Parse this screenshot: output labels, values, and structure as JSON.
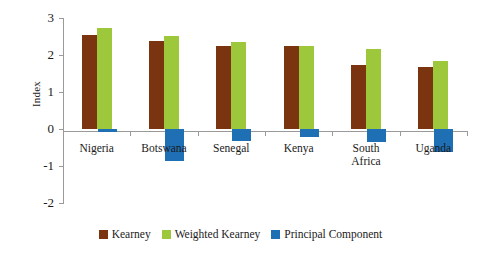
{
  "chart_data": {
    "type": "bar",
    "title": "",
    "xlabel": "",
    "ylabel": "Index",
    "ylim": [
      -2,
      3
    ],
    "yticks": [
      3,
      2,
      1,
      0,
      -1,
      -2
    ],
    "grid": false,
    "legend_position": "bottom",
    "categories": [
      "Nigeria",
      "Botswana",
      "Senegal",
      "Kenya",
      "South Africa",
      "Uganda"
    ],
    "series": [
      {
        "name": "Kearney",
        "color": "#7B3410",
        "values": [
          2.55,
          2.37,
          2.23,
          2.25,
          1.72,
          1.68
        ]
      },
      {
        "name": "Weighted Kearney",
        "color": "#9DC83C",
        "values": [
          2.73,
          2.52,
          2.35,
          2.25,
          2.17,
          1.83
        ]
      },
      {
        "name": "Principal Component",
        "color": "#1F6FB5",
        "values": [
          -0.08,
          -0.87,
          -0.32,
          -0.22,
          -0.35,
          -0.62
        ]
      }
    ]
  },
  "axis": {
    "y_title": "Index",
    "tick_labels": [
      "3",
      "2",
      "1",
      "0",
      "-1",
      "-2"
    ]
  },
  "legend": {
    "items": [
      {
        "label": "Kearney",
        "color": "#7B3410"
      },
      {
        "label": "Weighted Kearney",
        "color": "#9DC83C"
      },
      {
        "label": "Principal Component",
        "color": "#1F6FB5"
      }
    ]
  },
  "categories_display": [
    {
      "line1": "Nigeria",
      "line2": ""
    },
    {
      "line1": "Botswana",
      "line2": ""
    },
    {
      "line1": "Senegal",
      "line2": ""
    },
    {
      "line1": "Kenya",
      "line2": ""
    },
    {
      "line1": "South",
      "line2": "Africa"
    },
    {
      "line1": "Uganda",
      "line2": ""
    }
  ]
}
